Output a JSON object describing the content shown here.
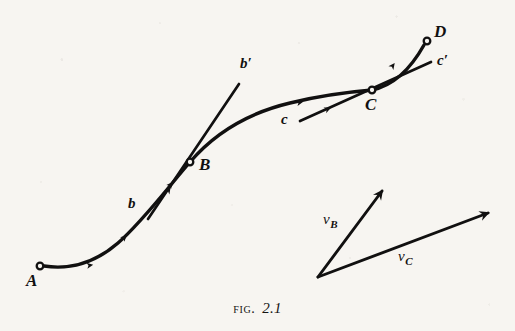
{
  "figure": {
    "caption_word": "Fig.",
    "caption_number": "2.1",
    "ink_color": "#111010",
    "paper_color": "#f7f5f1"
  },
  "points": [
    {
      "id": "A",
      "label": "A",
      "x": 38,
      "y": 267,
      "marker": "open-circle",
      "label_x": 28,
      "label_y": 277
    },
    {
      "id": "B",
      "label": "B",
      "x": 190,
      "y": 162,
      "marker": "open-circle",
      "label_x": 198,
      "label_y": 162
    },
    {
      "id": "C",
      "label": "C",
      "x": 372,
      "y": 90,
      "marker": "open-circle",
      "label_x": 364,
      "label_y": 100
    },
    {
      "id": "D",
      "label": "D",
      "x": 428,
      "y": 40,
      "marker": "open-circle",
      "label_x": 435,
      "label_y": 28
    }
  ],
  "tangents": [
    {
      "id": "tangent-at-B",
      "start_label": "b",
      "end_label": "b′",
      "through_point": "B",
      "start_x": 148,
      "start_y": 219,
      "end_x": 239,
      "end_y": 84,
      "start_label_x": 129,
      "start_label_y": 198,
      "end_label_x": 241,
      "end_label_y": 57
    },
    {
      "id": "tangent-at-C",
      "start_label": "c",
      "end_label": "c′",
      "through_point": "C",
      "start_x": 300,
      "start_y": 121,
      "end_x": 431,
      "end_y": 62,
      "start_label_x": 281,
      "start_label_y": 113,
      "end_label_x": 437,
      "end_label_y": 54
    }
  ],
  "path": {
    "name": "particle-trajectory",
    "from": "A",
    "to": "D",
    "arrow_count": 4,
    "description": "curved path of a moving point from A through B and C to D"
  },
  "vectors": [
    {
      "id": "vB",
      "label_base": "v",
      "label_sub": "B",
      "origin_x": 318,
      "origin_y": 277,
      "tip_x": 384,
      "tip_y": 188,
      "label_x": 324,
      "label_y": 213
    },
    {
      "id": "vC",
      "label_base": "v",
      "label_sub": "C",
      "origin_x": 318,
      "origin_y": 277,
      "tip_x": 491,
      "tip_y": 211,
      "label_x": 399,
      "label_y": 250
    }
  ]
}
